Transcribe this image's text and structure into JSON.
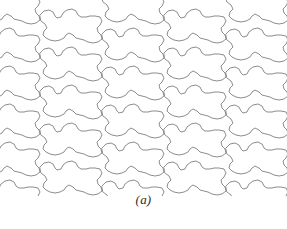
{
  "figure": {
    "caption": "(a)",
    "kind": "tessellation-diagram",
    "background_color": "#ffffff",
    "line_color": "#808080",
    "line_width": 0.9,
    "canvas": {
      "width": 287,
      "height": 196
    }
  },
  "tiling": {
    "tile_width": 62,
    "tile_height": 38,
    "columns": 5,
    "rows": 6,
    "column_offset_y": 19,
    "origin_x": -22,
    "origin_y": -14,
    "tile_outline": [
      [
        0,
        10
      ],
      [
        4,
        6
      ],
      [
        9,
        5
      ],
      [
        13,
        7
      ],
      [
        15,
        11
      ],
      [
        17,
        13
      ],
      [
        21,
        12
      ],
      [
        23,
        8
      ],
      [
        27,
        5
      ],
      [
        32,
        4
      ],
      [
        36,
        6
      ],
      [
        38,
        10
      ],
      [
        41,
        12
      ],
      [
        46,
        12
      ],
      [
        50,
        11
      ],
      [
        55,
        11
      ],
      [
        60,
        12
      ],
      [
        62,
        16
      ],
      [
        60,
        20
      ],
      [
        57,
        23
      ],
      [
        58,
        27
      ],
      [
        61,
        30
      ],
      [
        62,
        34
      ],
      [
        58,
        37
      ],
      [
        53,
        38
      ],
      [
        48,
        37
      ],
      [
        44,
        35
      ],
      [
        40,
        34
      ],
      [
        36,
        33
      ],
      [
        33,
        30
      ],
      [
        29,
        28
      ],
      [
        26,
        30
      ],
      [
        24,
        33
      ],
      [
        20,
        35
      ],
      [
        15,
        36
      ],
      [
        10,
        35
      ],
      [
        6,
        33
      ],
      [
        3,
        30
      ],
      [
        4,
        26
      ],
      [
        7,
        23
      ],
      [
        5,
        19
      ],
      [
        1,
        16
      ]
    ],
    "tile_label": "interlocking-tile"
  },
  "colors": {
    "stroke": "#808080",
    "fill": "#ffffff",
    "caption_text": "#2b2b2b"
  }
}
